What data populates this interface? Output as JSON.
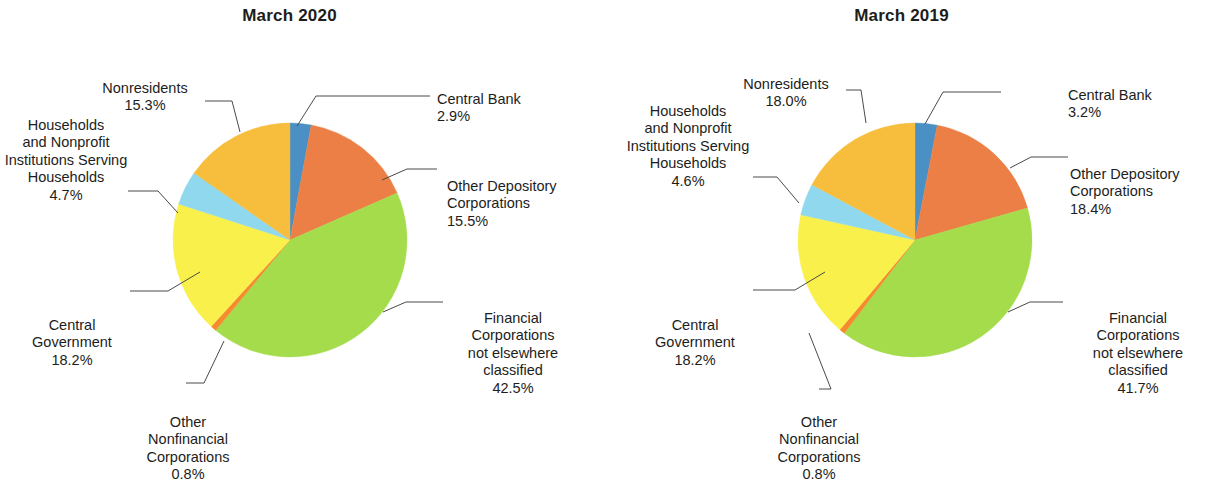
{
  "figure": {
    "background": "#ffffff",
    "palette": {
      "central_bank": "#4a90c4",
      "other_depository_corporations": "#ec7f45",
      "financial_corporations_nec": "#a5dc4b",
      "other_nonfinancial_corporations": "#f58a2e",
      "central_government": "#faf04b",
      "households_nonprofit": "#8fd8ee",
      "nonresidents": "#f7be3d",
      "leader_line": "#4a4a48",
      "text": "#1d1d1b"
    }
  },
  "panels": [
    {
      "id": "march-2020",
      "title": "March 2020",
      "labels": {
        "central_bank": {
          "name": "Central Bank",
          "pct": "2.9%"
        },
        "other_depository": {
          "name": "Other Depository\nCorporations",
          "pct": "15.5%"
        },
        "financial_nec": {
          "name": "Financial\nCorporations\nnot elsewhere\nclassified",
          "pct": "42.5%"
        },
        "other_nonfinancial": {
          "name": "Other\nNonfinancial\nCorporations",
          "pct": "0.8%"
        },
        "central_government": {
          "name": "Central\nGovernment",
          "pct": "18.2%"
        },
        "households": {
          "name": "Households\nand Nonprofit\nInstitutions Serving\nHouseholds",
          "pct": "4.7%"
        },
        "nonresidents": {
          "name": "Nonresidents",
          "pct": "15.3%"
        }
      }
    },
    {
      "id": "march-2019",
      "title": "March 2019",
      "labels": {
        "central_bank": {
          "name": "Central Bank",
          "pct": "3.2%"
        },
        "other_depository": {
          "name": "Other Depository\nCorporations",
          "pct": "18.4%"
        },
        "financial_nec": {
          "name": "Financial\nCorporations\nnot elsewhere\nclassified",
          "pct": "41.7%"
        },
        "other_nonfinancial": {
          "name": "Other\nNonfinancial\nCorporations",
          "pct": "0.8%"
        },
        "central_government": {
          "name": "Central\nGovernment",
          "pct": "18.2%"
        },
        "households": {
          "name": "Households\nand Nonprofit\nInstitutions Serving\nHouseholds",
          "pct": "4.6%"
        },
        "nonresidents": {
          "name": "Nonresidents",
          "pct": "18.0%"
        }
      }
    }
  ],
  "chart_data": [
    {
      "type": "pie",
      "title": "March 2020",
      "start_angle_deg": 0,
      "direction": "clockwise",
      "labels": [
        "Central Bank",
        "Other Depository Corporations",
        "Financial Corporations not elsewhere classified",
        "Other Nonfinancial Corporations",
        "Central Government",
        "Households and Nonprofit Institutions Serving Households",
        "Nonresidents"
      ],
      "values": [
        2.9,
        15.5,
        42.5,
        0.8,
        18.2,
        4.7,
        15.3
      ],
      "value_labels": [
        "2.9%",
        "15.5%",
        "42.5%",
        "0.8%",
        "18.2%",
        "4.7%",
        "15.3%"
      ],
      "colors": [
        "#4a90c4",
        "#ec7f45",
        "#a5dc4b",
        "#f58a2e",
        "#faf04b",
        "#8fd8ee",
        "#f7be3d"
      ],
      "units": "percent",
      "legend": "labels with leader lines"
    },
    {
      "type": "pie",
      "title": "March 2019",
      "start_angle_deg": 0,
      "direction": "clockwise",
      "labels": [
        "Central Bank",
        "Other Depository Corporations",
        "Financial Corporations not elsewhere classified",
        "Other Nonfinancial Corporations",
        "Central Government",
        "Households and Nonprofit Institutions Serving Households",
        "Nonresidents"
      ],
      "values": [
        3.2,
        18.4,
        41.7,
        0.8,
        18.2,
        4.6,
        18.0
      ],
      "value_labels": [
        "3.2%",
        "18.4%",
        "41.7%",
        "0.8%",
        "18.2%",
        "4.6%",
        "18.0%"
      ],
      "colors": [
        "#4a90c4",
        "#ec7f45",
        "#a5dc4b",
        "#f58a2e",
        "#faf04b",
        "#8fd8ee",
        "#f7be3d"
      ],
      "units": "percent",
      "legend": "labels with leader lines"
    }
  ]
}
